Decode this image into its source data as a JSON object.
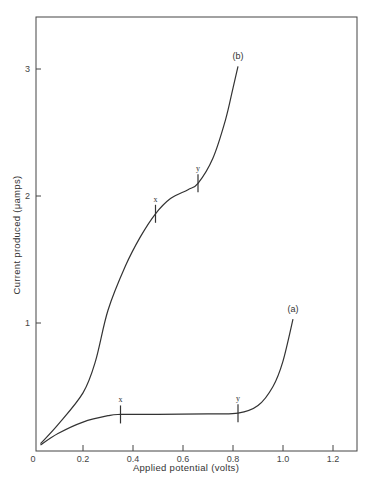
{
  "chart_data": {
    "type": "line",
    "title": "",
    "xlabel": "Applied potential (volts)",
    "ylabel": "Current produced (μamps)",
    "xlim": [
      0,
      1.3
    ],
    "ylim": [
      0,
      3.4
    ],
    "xticks": [
      0,
      0.2,
      0.4,
      0.6,
      0.8,
      1.0,
      1.2
    ],
    "xtick_labels": [
      "0",
      "0.2",
      "0.4",
      "0.6",
      "0.8",
      "1.0",
      "1.2"
    ],
    "yticks": [
      1,
      2,
      3
    ],
    "ytick_labels": [
      "1",
      "2",
      "3"
    ],
    "grid": false,
    "legend": "none (curves labeled inline)",
    "series": [
      {
        "name": "(a)",
        "x": [
          0.03,
          0.1,
          0.2,
          0.3,
          0.35,
          0.5,
          0.7,
          0.82,
          0.9,
          0.96,
          1.0,
          1.04
        ],
        "y": [
          0.04,
          0.13,
          0.22,
          0.27,
          0.28,
          0.28,
          0.285,
          0.29,
          0.35,
          0.5,
          0.7,
          1.03
        ],
        "markers": [
          {
            "label": "x",
            "x": 0.35,
            "y": 0.28
          },
          {
            "label": "y",
            "x": 0.82,
            "y": 0.29
          }
        ]
      },
      {
        "name": "(b)",
        "x": [
          0.03,
          0.1,
          0.2,
          0.25,
          0.3,
          0.37,
          0.43,
          0.49,
          0.55,
          0.62,
          0.66,
          0.72,
          0.77,
          0.8,
          0.82
        ],
        "y": [
          0.05,
          0.2,
          0.45,
          0.7,
          1.1,
          1.45,
          1.68,
          1.86,
          1.98,
          2.05,
          2.1,
          2.3,
          2.6,
          2.85,
          3.02
        ],
        "markers": [
          {
            "label": "x",
            "x": 0.49,
            "y": 1.86
          },
          {
            "label": "y",
            "x": 0.66,
            "y": 2.1
          }
        ]
      }
    ]
  }
}
